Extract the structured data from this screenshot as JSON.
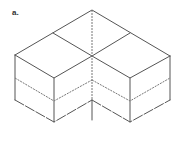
{
  "figure": {
    "panel_label": "a.",
    "colors": {
      "stroke": "#555555",
      "dashed_stroke": "#777777",
      "background": "#ffffff"
    }
  }
}
